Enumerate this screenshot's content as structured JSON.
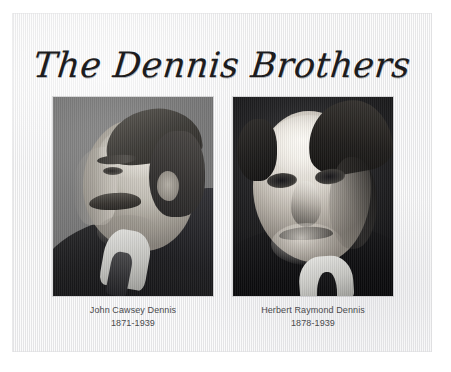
{
  "document": {
    "title": "The Dennis Brothers",
    "clipped_text_top": "",
    "clipped_text_bottom": ""
  },
  "portraits": [
    {
      "id": "john-cawsey-dennis",
      "name": "John Cawsey Dennis",
      "dates": "1871-1939",
      "description": "black-and-white profile portrait of an older man facing left, with a moustache, dark suit, white collar and tie, on a light grey studio background"
    },
    {
      "id": "herbert-raymond-dennis",
      "name": "Herbert Raymond Dennis",
      "dates": "1878-1939",
      "description": "high-contrast black-and-white three-quarter portrait of a man with a moustache, dark suit and white collar, on a dark background"
    }
  ],
  "colors": {
    "page_background": "#ffffff",
    "card_background": "#e9e9ea",
    "title_text": "#1c1c1e",
    "caption_text": "#4a4a4e"
  }
}
